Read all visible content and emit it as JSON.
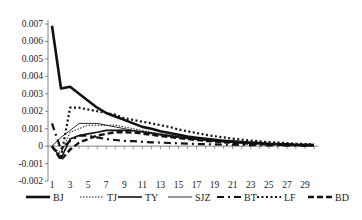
{
  "chart_data": {
    "type": "line",
    "title": "",
    "xlabel": "",
    "ylabel": "",
    "x": [
      1,
      2,
      3,
      4,
      5,
      6,
      7,
      8,
      9,
      10,
      11,
      12,
      13,
      14,
      15,
      16,
      17,
      18,
      19,
      20,
      21,
      22,
      23,
      24,
      25,
      26,
      27,
      28,
      29,
      30
    ],
    "x_tick_labels": [
      "1",
      "3",
      "5",
      "7",
      "9",
      "11",
      "13",
      "15",
      "17",
      "19",
      "21",
      "23",
      "25",
      "27",
      "29"
    ],
    "y_tick_labels": [
      "0.007",
      "0.006",
      "0.005",
      "0.004",
      "0.003",
      "0.002",
      "0.001",
      "0",
      "-0.001",
      "-0.002"
    ],
    "ylim": [
      -0.002,
      0.007
    ],
    "grid": false,
    "legend_position": "bottom",
    "series": [
      {
        "name": "BJ",
        "style": "solid-thick",
        "values": [
          0.0069,
          0.0033,
          0.0034,
          0.003,
          0.0026,
          0.0022,
          0.0019,
          0.0017,
          0.0015,
          0.0013,
          0.0011,
          0.001,
          0.00085,
          0.00075,
          0.00065,
          0.00055,
          0.00048,
          0.00042,
          0.00036,
          0.00031,
          0.00027,
          0.00023,
          0.0002,
          0.00017,
          0.00014,
          0.00012,
          0.0001,
          8e-05,
          7e-05,
          6e-05
        ]
      },
      {
        "name": "TJ",
        "style": "dotted-thin",
        "values": [
          0.0,
          -0.0004,
          0.0008,
          0.001,
          0.0012,
          0.0012,
          0.0012,
          0.0012,
          0.0011,
          0.001,
          0.0009,
          0.0008,
          0.0007,
          0.00062,
          0.00055,
          0.00048,
          0.00042,
          0.00036,
          0.00031,
          0.00027,
          0.00023,
          0.0002,
          0.00017,
          0.00015,
          0.00013,
          0.00011,
          0.0001,
          8e-05,
          7e-05,
          6e-05
        ]
      },
      {
        "name": "TY",
        "style": "solid-medium",
        "values": [
          0.0,
          -0.0007,
          0.0004,
          0.0006,
          0.0007,
          0.0008,
          0.0009,
          0.0009,
          0.0009,
          0.00088,
          0.00082,
          0.00075,
          0.00068,
          0.0006,
          0.00053,
          0.00047,
          0.00041,
          0.00036,
          0.00031,
          0.00027,
          0.00023,
          0.0002,
          0.00017,
          0.00015,
          0.00013,
          0.00011,
          0.0001,
          8e-05,
          7e-05,
          6e-05
        ]
      },
      {
        "name": "SJZ",
        "style": "solid-thin",
        "values": [
          0.0,
          0.0005,
          0.0009,
          0.0013,
          0.0013,
          0.0013,
          0.0012,
          0.0011,
          0.001,
          0.0009,
          0.0008,
          0.0007,
          0.00062,
          0.00055,
          0.00048,
          0.00042,
          0.00036,
          0.00031,
          0.00027,
          0.00023,
          0.0002,
          0.00017,
          0.00015,
          0.00013,
          0.00011,
          0.0001,
          8e-05,
          7e-05,
          6e-05,
          5e-05
        ]
      },
      {
        "name": "BT",
        "style": "dash-dot",
        "values": [
          0.0013,
          -0.0002,
          0.0003,
          0.0006,
          0.0006,
          0.0005,
          0.0004,
          0.00035,
          0.0003,
          0.00028,
          0.00025,
          0.00022,
          0.0002,
          0.00018,
          0.00016,
          0.00014,
          0.00012,
          0.00011,
          0.0001,
          9e-05,
          8e-05,
          7e-05,
          6e-05,
          5e-05,
          4e-05,
          4e-05,
          3e-05,
          3e-05,
          2e-05,
          2e-05
        ]
      },
      {
        "name": "LF",
        "style": "dotted-thick",
        "values": [
          0.0,
          -0.0006,
          0.0022,
          0.0022,
          0.0021,
          0.002,
          0.0019,
          0.0018,
          0.0016,
          0.0015,
          0.0014,
          0.0013,
          0.0012,
          0.0011,
          0.00095,
          0.00085,
          0.00075,
          0.00065,
          0.00057,
          0.0005,
          0.00043,
          0.00037,
          0.00032,
          0.00027,
          0.00023,
          0.0002,
          0.00017,
          0.00014,
          0.00012,
          0.0001
        ]
      },
      {
        "name": "BD",
        "style": "dashed-thick",
        "values": [
          0.0,
          -0.0008,
          -0.0002,
          0.0002,
          0.0004,
          0.0006,
          0.0007,
          0.0008,
          0.0008,
          0.00078,
          0.00072,
          0.00065,
          0.00058,
          0.00052,
          0.00046,
          0.0004,
          0.00035,
          0.0003,
          0.00026,
          0.00022,
          0.00019,
          0.00016,
          0.00014,
          0.00012,
          0.0001,
          8e-05,
          7e-05,
          6e-05,
          5e-05,
          4e-05
        ]
      }
    ]
  },
  "legend": {
    "items": [
      "BJ",
      "TJ",
      "TY",
      "SJZ",
      "BT",
      "LF",
      "BD"
    ]
  }
}
